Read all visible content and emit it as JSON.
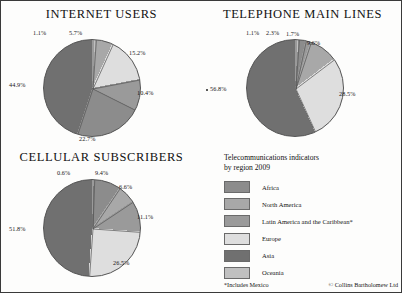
{
  "colors": {
    "africa": "#8c8c8c",
    "north_america": "#a8a8a8",
    "latin_america": "#9a9a9a",
    "europe": "#dedede",
    "asia": "#707070",
    "oceania": "#c0c0c0",
    "outline": "#555555",
    "page_border": "#3a3a3a"
  },
  "legend": {
    "title_line1": "Telecommunications indicators",
    "title_line2": "by region 2009",
    "items": [
      {
        "label": "Africa",
        "color": "#8c8c8c"
      },
      {
        "label": "North America",
        "color": "#a8a8a8"
      },
      {
        "label": "Latin America and the Caribbean*",
        "color": "#9a9a9a"
      },
      {
        "label": "Europe",
        "color": "#dedede"
      },
      {
        "label": "Asia",
        "color": "#707070"
      },
      {
        "label": "Oceania",
        "color": "#c0c0c0"
      }
    ],
    "footnote": "*Includes Mexico",
    "credit": "© Collins Bartholomew Ltd"
  },
  "chart_data": [
    {
      "type": "pie",
      "title": "INTERNET  USERS",
      "categories": [
        "Oceania",
        "North America",
        "Europe",
        "Latin America and the Caribbean*",
        "Africa",
        "Asia"
      ],
      "values": [
        1.1,
        5.7,
        15.2,
        10.4,
        22.7,
        44.9
      ],
      "labels": [
        "1.1%",
        "5.7%",
        "15.2%",
        "10.4%",
        "22.7%",
        "44.9%"
      ],
      "unit": "%",
      "legend": "shared"
    },
    {
      "type": "pie",
      "title": "TELEPHONE MAIN LINES",
      "categories": [
        "Oceania",
        "Africa",
        "Latin America and the Caribbean*",
        "North America",
        "Europe",
        "Asia"
      ],
      "values": [
        1.1,
        2.3,
        1.7,
        9.6,
        28.5,
        56.8
      ],
      "labels": [
        "1.1%",
        "2.3%",
        "1.7%",
        "9.6%",
        "28.5%",
        "56.8%"
      ],
      "unit": "%",
      "legend": "shared"
    },
    {
      "type": "pie",
      "title": "CELLULAR SUBSCRIBERS",
      "categories": [
        "Oceania",
        "Africa",
        "North America",
        "Latin America and the Caribbean*",
        "Europe",
        "Asia"
      ],
      "values": [
        0.6,
        9.4,
        6.6,
        11.1,
        26.5,
        51.8
      ],
      "labels": [
        "0.6%",
        "9.4%",
        "6.6%",
        "11.1%",
        "26.5%",
        "51.8%"
      ],
      "unit": "%",
      "legend": "shared"
    }
  ]
}
